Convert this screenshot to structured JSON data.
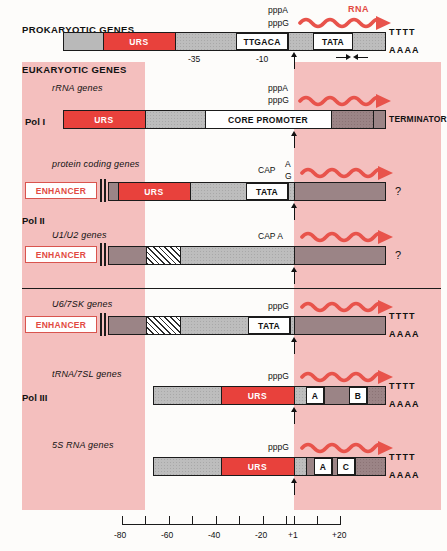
{
  "figure": {
    "headers": {
      "prokaryotic": "PROKARYOTIC GENES",
      "eukaryotic": "EUKARYOTIC GENES"
    },
    "pol_labels": {
      "pol1": "Pol I",
      "pol2": "Pol II",
      "pol3": "Pol III"
    },
    "rna_label": "RNA",
    "rows": [
      {
        "id": "prokaryotic",
        "title": "",
        "start_label_top": "pppA",
        "start_label_bottom": "pppG",
        "tail_top": "TTTT",
        "tail_bottom": "AAAA",
        "boxes": [
          "URS",
          "TTGACA",
          "TATA"
        ],
        "tick_labels": [
          "-35",
          "-10"
        ]
      },
      {
        "id": "rrna",
        "title": "rRNA genes",
        "start_label_top": "pppA",
        "start_label_bottom": "pppG",
        "boxes": [
          "URS",
          "CORE PROMOTER"
        ],
        "terminator": "TERMINATOR"
      },
      {
        "id": "protein-coding",
        "title": "protein coding genes",
        "cap_label": "CAP",
        "cap_top": "A",
        "cap_bottom": "G",
        "boxes": [
          "ENHANCER",
          "URS",
          "TATA"
        ],
        "end_mark": "?"
      },
      {
        "id": "u1-u2",
        "title": "U1/U2 genes",
        "cap_label": "CAP A",
        "boxes": [
          "ENHANCER"
        ],
        "end_mark": "?"
      },
      {
        "id": "u6-7sk",
        "title": "U6/7SK genes",
        "start_label": "pppG",
        "boxes": [
          "ENHANCER",
          "TATA"
        ],
        "tail_top": "TTTT",
        "tail_bottom": "AAAA"
      },
      {
        "id": "trna-7sl",
        "title": "tRNA/7SL genes",
        "start_label": "pppG",
        "boxes": [
          "URS",
          "A",
          "B"
        ],
        "tail_top": "TTTT",
        "tail_bottom": "AAAA"
      },
      {
        "id": "5s-rna",
        "title": "5S RNA genes",
        "start_label": "pppG",
        "boxes": [
          "URS",
          "A",
          "C"
        ],
        "tail_top": "TTTT",
        "tail_bottom": "AAAA"
      }
    ],
    "axis": {
      "labels": [
        "-80",
        "-60",
        "-40",
        "-20",
        "+1",
        "+20"
      ]
    },
    "colors": {
      "urs_red": "#e8413c",
      "rna_red": "#e24a42",
      "band_pink": "#f4bfbe",
      "gray_light": "#b9b9b9",
      "gray_dark": "#9b8486"
    }
  }
}
